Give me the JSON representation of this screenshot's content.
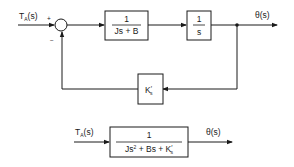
{
  "diagram": {
    "type": "block-diagram",
    "top": {
      "input_label": "T",
      "input_sub": "A",
      "input_arg": "(s)",
      "plus_sign": "+",
      "minus_sign": "−",
      "block1": {
        "numerator": "1",
        "denominator": "Js + B"
      },
      "block2": {
        "numerator": "1",
        "denominator": "s"
      },
      "output_label": "θ(s)",
      "feedback_block": {
        "main": "K",
        "prime": "′",
        "sub": "s"
      }
    },
    "bottom": {
      "input_label": "T",
      "input_sub": "A",
      "input_arg": "(s)",
      "block": {
        "numerator": "1",
        "den_part1": "Js",
        "den_sup": "2",
        "den_part2": " + Bs + K",
        "den_prime": "′",
        "den_sub": "s"
      },
      "output_label": "θ(s)"
    },
    "colors": {
      "line": "#1a1a1a",
      "background": "#ffffff"
    }
  }
}
